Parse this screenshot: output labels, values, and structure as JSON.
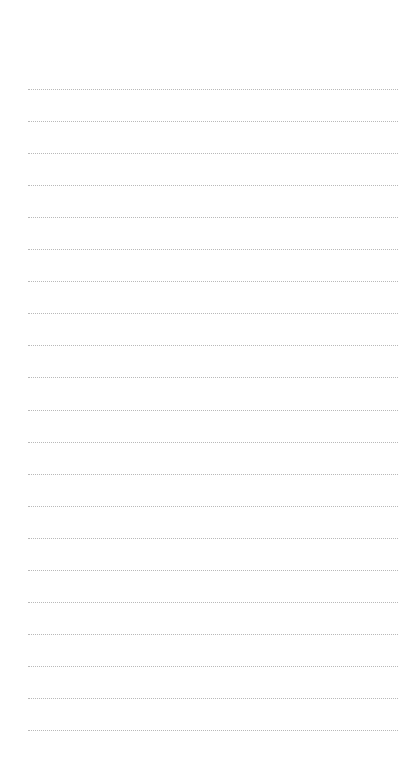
{
  "page": {
    "type": "lined-notepaper",
    "background_color": "#ffffff",
    "line_color": "#b9b9b9",
    "line_style": "dotted",
    "line_count": 21,
    "first_line_y": 89,
    "line_spacing": 32.05,
    "line_left_x": 28,
    "line_right_x": 398
  }
}
